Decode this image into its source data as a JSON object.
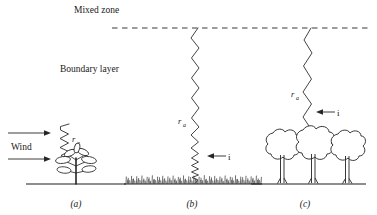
{
  "figure": {
    "title_labels": {
      "mixed_zone": "Mixed zone",
      "boundary_layer": "Boundary layer"
    },
    "captions": [
      {
        "key": "a",
        "text": "(a)",
        "x": 76,
        "y": 207
      },
      {
        "key": "b",
        "text": "(b)",
        "x": 192,
        "y": 207
      },
      {
        "key": "c",
        "text": "(c)",
        "x": 305,
        "y": 207
      }
    ],
    "annotations": {
      "wind_label": "Wind",
      "resistance_symbol": "r",
      "resistance_subscript": "a",
      "flux_symbol": "i"
    },
    "panels": [
      {
        "id": "a",
        "caption": "(a)",
        "vegetation": "single-plant",
        "resistance_label": "r",
        "resistance_subscript": "a",
        "wind_arrow_count": 2,
        "has_flux_arrow": false,
        "ground_y": 184
      },
      {
        "id": "b",
        "caption": "(b)",
        "vegetation": "grass-sward",
        "resistance_label": "r",
        "resistance_subscript": "a",
        "flux_label": "i",
        "has_flux_arrow": true,
        "ground_y": 184
      },
      {
        "id": "c",
        "caption": "(c)",
        "vegetation": "tree-canopy",
        "tree_count": 3,
        "resistance_label": "r",
        "resistance_subscript": "a",
        "flux_label": "i",
        "has_flux_arrow": true,
        "ground_y": 184
      }
    ],
    "colors": {
      "ink": "#1a1a1a",
      "line": "#2b2b2b",
      "zigzag": "#3a3a3a",
      "background": "#ffffff"
    },
    "mixed_zone_line": {
      "y": 28,
      "x_start": 112,
      "x_end": 372,
      "style": "dashed"
    }
  }
}
